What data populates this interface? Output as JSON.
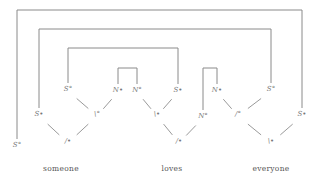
{
  "diagram": {
    "type": "proof-net",
    "words": [
      {
        "id": "someone",
        "text": "someone",
        "x": 61,
        "y": 171
      },
      {
        "id": "loves",
        "text": "loves",
        "x": 172,
        "y": 171
      },
      {
        "id": "everyone",
        "text": "everyone",
        "x": 271,
        "y": 171
      }
    ],
    "nodes": [
      {
        "id": "n1",
        "text": "S°",
        "x": 17,
        "y": 147
      },
      {
        "id": "n2",
        "text": "S•",
        "x": 39,
        "y": 116
      },
      {
        "id": "n3",
        "text": "S°",
        "x": 68,
        "y": 91
      },
      {
        "id": "n4",
        "text": "/•",
        "x": 68,
        "y": 143
      },
      {
        "id": "n5",
        "text": "\\°",
        "x": 97,
        "y": 116
      },
      {
        "id": "n6",
        "text": "N•",
        "x": 118,
        "y": 92
      },
      {
        "id": "n7",
        "text": "N°",
        "x": 137,
        "y": 92
      },
      {
        "id": "n8",
        "text": "S•",
        "x": 178,
        "y": 92
      },
      {
        "id": "n9",
        "text": "\\•",
        "x": 157,
        "y": 116
      },
      {
        "id": "n10",
        "text": "/•",
        "x": 179,
        "y": 143
      },
      {
        "id": "n11",
        "text": "N°",
        "x": 203,
        "y": 118
      },
      {
        "id": "n12",
        "text": "N•",
        "x": 217,
        "y": 92
      },
      {
        "id": "n13",
        "text": "/°",
        "x": 238,
        "y": 116
      },
      {
        "id": "n14",
        "text": "S°",
        "x": 271,
        "y": 91
      },
      {
        "id": "n15",
        "text": "\\•",
        "x": 271,
        "y": 143
      },
      {
        "id": "n16",
        "text": "S•",
        "x": 302,
        "y": 116
      }
    ],
    "axiom_links": [
      {
        "from": "n1",
        "to": "n16",
        "top_y": 10
      },
      {
        "from": "n2",
        "to": "n14",
        "top_y": 29
      },
      {
        "from": "n3",
        "to": "n8",
        "top_y": 48
      },
      {
        "from": "n6",
        "to": "n7",
        "top_y": 68
      },
      {
        "from": "n11",
        "to": "n12",
        "top_y": 68
      }
    ],
    "tree_links": [
      {
        "from": "n2",
        "to": "n4"
      },
      {
        "from": "n5",
        "to": "n4"
      },
      {
        "from": "n3",
        "to": "n5"
      },
      {
        "from": "n6",
        "to": "n5"
      },
      {
        "from": "n7",
        "to": "n9"
      },
      {
        "from": "n8",
        "to": "n9"
      },
      {
        "from": "n9",
        "to": "n10"
      },
      {
        "from": "n11",
        "to": "n10"
      },
      {
        "from": "n12",
        "to": "n13"
      },
      {
        "from": "n14",
        "to": "n13"
      },
      {
        "from": "n13",
        "to": "n15"
      },
      {
        "from": "n16",
        "to": "n15"
      }
    ],
    "colors": {
      "wire": "#8a8a8a",
      "label": "#777777",
      "word": "#555555"
    }
  }
}
